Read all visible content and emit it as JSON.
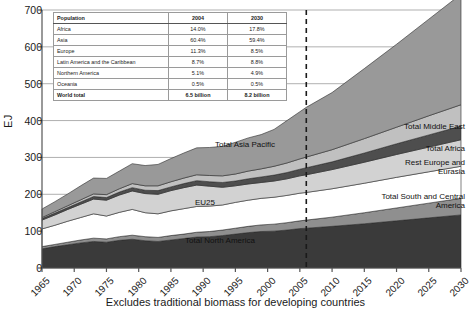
{
  "chart_data": {
    "type": "area",
    "title": "",
    "subtitle": "",
    "xlabel": "Excludes traditional biomass for developing countries",
    "ylabel": "EJ",
    "ylim": [
      0,
      700
    ],
    "xlim": [
      1965,
      2030
    ],
    "grid": true,
    "legend_position": "inline-annotations",
    "stacked": true,
    "forecast_divider_x": 2006,
    "ytick_labels": [
      "0",
      "100",
      "200",
      "300",
      "400",
      "500",
      "600",
      "700"
    ],
    "ytick_values": [
      0,
      100,
      200,
      300,
      400,
      500,
      600,
      700
    ],
    "xtick_labels": [
      "1965",
      "1970",
      "1975",
      "1980",
      "1985",
      "1990",
      "1995",
      "2000",
      "2005",
      "2010",
      "2015",
      "2020",
      "2025",
      "2030"
    ],
    "xtick_values": [
      1965,
      1970,
      1975,
      1980,
      1985,
      1990,
      1995,
      2000,
      2005,
      2010,
      2015,
      2020,
      2025,
      2030
    ],
    "x": [
      1965,
      1967,
      1969,
      1971,
      1973,
      1975,
      1977,
      1979,
      1981,
      1983,
      1985,
      1987,
      1989,
      1991,
      1993,
      1995,
      1997,
      1999,
      2001,
      2003,
      2005,
      2006,
      2010,
      2015,
      2020,
      2025,
      2030
    ],
    "series": [
      {
        "name": "Total North America",
        "color": "#3a3a3a",
        "values": [
          52,
          58,
          63,
          68,
          72,
          70,
          75,
          78,
          74,
          72,
          76,
          80,
          84,
          85,
          88,
          92,
          96,
          99,
          100,
          103,
          107,
          108,
          113,
          120,
          128,
          136,
          144
        ]
      },
      {
        "name": "Total South and Central America",
        "color": "#8f8f8f",
        "values": [
          6,
          6,
          7,
          8,
          9,
          9,
          10,
          11,
          11,
          11,
          12,
          12,
          13,
          14,
          15,
          16,
          17,
          18,
          19,
          20,
          21,
          22,
          25,
          30,
          35,
          40,
          45
        ]
      },
      {
        "name": "EU25",
        "color": "#ffffff",
        "values": [
          48,
          52,
          57,
          61,
          66,
          62,
          66,
          70,
          65,
          64,
          67,
          69,
          70,
          69,
          68,
          70,
          71,
          72,
          73,
          74,
          75,
          75,
          77,
          80,
          83,
          85,
          87
        ]
      },
      {
        "name": "Rest Europe and Eurasia",
        "color": "#d2d2d2",
        "values": [
          24,
          28,
          32,
          36,
          40,
          43,
          47,
          50,
          52,
          53,
          55,
          57,
          58,
          54,
          48,
          45,
          44,
          43,
          44,
          45,
          47,
          48,
          52,
          57,
          62,
          67,
          72
        ]
      },
      {
        "name": "Total Africa",
        "color": "#4e4e4e",
        "values": [
          4,
          5,
          5,
          6,
          7,
          7,
          8,
          9,
          9,
          10,
          10,
          11,
          12,
          12,
          13,
          13,
          14,
          15,
          16,
          17,
          18,
          19,
          21,
          25,
          29,
          33,
          37
        ]
      },
      {
        "name": "Total Middle East",
        "color": "#c0c0c0",
        "values": [
          3,
          4,
          5,
          6,
          7,
          8,
          9,
          11,
          12,
          13,
          14,
          15,
          16,
          17,
          18,
          19,
          21,
          22,
          24,
          26,
          28,
          29,
          33,
          39,
          45,
          52,
          58
        ]
      },
      {
        "name": "Total Asia Pacific",
        "color": "#999999",
        "values": [
          23,
          27,
          32,
          38,
          43,
          44,
          48,
          54,
          55,
          58,
          63,
          68,
          73,
          76,
          80,
          86,
          90,
          93,
          100,
          115,
          128,
          135,
          155,
          190,
          225,
          262,
          300
        ]
      }
    ],
    "annotations": [
      "Total Middle East",
      "Total Africa",
      "Rest Europe and Eurasia",
      "Total South and Central America",
      "Total Asia Pacific",
      "EU25",
      "Total North America"
    ]
  },
  "population_table": {
    "header": [
      "Population",
      "2004",
      "2030"
    ],
    "rows": [
      [
        "Africa",
        "14.0%",
        "17.8%"
      ],
      [
        "Asia",
        "60.4%",
        "59.4%"
      ],
      [
        "Europe",
        "11.3%",
        "8.5%"
      ],
      [
        "Latin America and the Caribbean",
        "8.7%",
        "8.8%"
      ],
      [
        "Northern America",
        "5.1%",
        "4.9%"
      ],
      [
        "Oceania",
        "0.5%",
        "0.5%"
      ]
    ],
    "total_row": [
      "World total",
      "6.5 billion",
      "8.2 billion"
    ]
  },
  "labels": {
    "asia_pacific": "Total Asia Pacific",
    "middle_east": "Total Middle East",
    "africa": "Total Africa",
    "rest_europe": "Rest Europe and",
    "rest_europe2": "Eurasia",
    "south_central": "Total South and Central",
    "south_central2": "America",
    "eu25": "EU25",
    "north_america": "Total North America"
  }
}
